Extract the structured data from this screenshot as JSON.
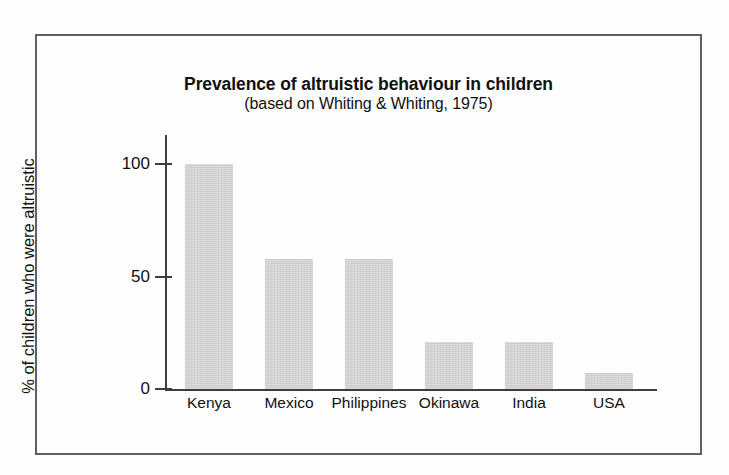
{
  "figure": {
    "title": "Prevalence of altruistic behaviour in children",
    "subtitle": "(based on Whiting & Whiting, 1975)",
    "frame_color": "#5d6066",
    "bar_color": "#cfcfcf",
    "axis_color": "#3b3d40",
    "background": "#fefefe"
  },
  "chart_data": {
    "type": "bar",
    "title": "Prevalence of altruistic behaviour in children",
    "subtitle": "(based on Whiting & Whiting, 1975)",
    "xlabel": "",
    "ylabel": "% of children who were altruistic",
    "categories": [
      "Kenya",
      "Mexico",
      "Philippines",
      "Okinawa",
      "India",
      "USA"
    ],
    "values": [
      100,
      58,
      58,
      21,
      21,
      7
    ],
    "ylim": [
      0,
      115
    ],
    "yticks": [
      0,
      50,
      100
    ],
    "ytick_labels": [
      "0",
      "50",
      "100"
    ],
    "grid": false,
    "legend": false,
    "series": [
      {
        "name": "% of children who were altruistic",
        "values": [
          100,
          58,
          58,
          21,
          21,
          7
        ]
      }
    ]
  }
}
